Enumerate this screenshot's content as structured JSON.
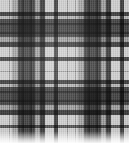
{
  "image": {
    "subject": "tartan-plaid-fabric-swatch",
    "width": 129,
    "height": 143,
    "palette_mode": "grayscale",
    "background_color": "#ffffff"
  },
  "chart_data": {
    "type": "heatmap",
    "xlabel": "warp position (px)",
    "ylabel": "weft position (px)",
    "xlim": [
      0,
      129
    ],
    "ylim": [
      0,
      143
    ],
    "grid": false,
    "legend_position": "none",
    "ground_color": "#c8c8c8",
    "sett_repeat_px": 66,
    "warp_stripes": [
      {
        "name": "light-ground-left",
        "x": 0,
        "width": 9,
        "color": "#d8d8d8",
        "alpha": 0.0
      },
      {
        "name": "accent-line-a1",
        "x": 9,
        "width": 1,
        "color": "#9a9a9a",
        "alpha": 0.55
      },
      {
        "name": "mid-shade-a",
        "x": 12,
        "width": 6,
        "color": "#b0b0b0",
        "alpha": 0.7
      },
      {
        "name": "dark-block-1",
        "x": 18,
        "width": 17,
        "color": "#4a4a4a",
        "alpha": 0.92
      },
      {
        "name": "accent-line-a2",
        "x": 22,
        "width": 2,
        "color": "#2e2e2e",
        "alpha": 0.7
      },
      {
        "name": "accent-line-a3",
        "x": 30,
        "width": 2,
        "color": "#2e2e2e",
        "alpha": 0.7
      },
      {
        "name": "mid-shade-b",
        "x": 35,
        "width": 5,
        "color": "#9e9e9e",
        "alpha": 0.65
      },
      {
        "name": "dark-line-1",
        "x": 40,
        "width": 5,
        "color": "#3c3c3c",
        "alpha": 0.9
      },
      {
        "name": "light-ground-mid",
        "x": 45,
        "width": 9,
        "color": "#e0e0e0",
        "alpha": 0.0
      },
      {
        "name": "dark-line-2",
        "x": 54,
        "width": 4,
        "color": "#3c3c3c",
        "alpha": 0.88
      },
      {
        "name": "light-ground-mid2",
        "x": 58,
        "width": 9,
        "color": "#e2e2e2",
        "alpha": 0.0
      },
      {
        "name": "hairline-center",
        "x": 67,
        "width": 1,
        "color": "#8e8e8e",
        "alpha": 0.5
      },
      {
        "name": "light-ground-mid3",
        "x": 68,
        "width": 7,
        "color": "#e2e2e2",
        "alpha": 0.0
      },
      {
        "name": "accent-line-b1",
        "x": 75,
        "width": 1,
        "color": "#9a9a9a",
        "alpha": 0.55
      },
      {
        "name": "mid-shade-c",
        "x": 78,
        "width": 6,
        "color": "#b0b0b0",
        "alpha": 0.7
      },
      {
        "name": "dark-block-2",
        "x": 84,
        "width": 17,
        "color": "#4a4a4a",
        "alpha": 0.92
      },
      {
        "name": "accent-line-b2",
        "x": 88,
        "width": 2,
        "color": "#2e2e2e",
        "alpha": 0.7
      },
      {
        "name": "accent-line-b3",
        "x": 96,
        "width": 2,
        "color": "#2e2e2e",
        "alpha": 0.7
      },
      {
        "name": "mid-shade-d",
        "x": 101,
        "width": 5,
        "color": "#9e9e9e",
        "alpha": 0.65
      },
      {
        "name": "dark-line-3",
        "x": 106,
        "width": 5,
        "color": "#3c3c3c",
        "alpha": 0.9
      },
      {
        "name": "light-ground-right",
        "x": 111,
        "width": 9,
        "color": "#e0e0e0",
        "alpha": 0.0
      },
      {
        "name": "dark-line-4",
        "x": 120,
        "width": 4,
        "color": "#3c3c3c",
        "alpha": 0.88
      },
      {
        "name": "light-ground-edge",
        "x": 124,
        "width": 5,
        "color": "#e2e2e2",
        "alpha": 0.0
      }
    ],
    "weft_stripes": [
      {
        "name": "light-band-top",
        "y": 0,
        "height": 12,
        "color": "#dcdcdc",
        "alpha": 0.0
      },
      {
        "name": "dark-line-t1",
        "y": 12,
        "height": 4,
        "color": "#3a3a3a",
        "alpha": 0.88
      },
      {
        "name": "mid-gap-t1",
        "y": 16,
        "height": 3,
        "color": "#b4b4b4",
        "alpha": 0.45
      },
      {
        "name": "dark-block-t",
        "y": 19,
        "height": 18,
        "color": "#484848",
        "alpha": 0.92
      },
      {
        "name": "accent-line-t1",
        "y": 23,
        "height": 2,
        "color": "#2c2c2c",
        "alpha": 0.7
      },
      {
        "name": "accent-line-t2",
        "y": 32,
        "height": 2,
        "color": "#2c2c2c",
        "alpha": 0.7
      },
      {
        "name": "mid-shade-t",
        "y": 37,
        "height": 5,
        "color": "#a0a0a0",
        "alpha": 0.65
      },
      {
        "name": "dark-line-t2",
        "y": 42,
        "height": 5,
        "color": "#3c3c3c",
        "alpha": 0.9
      },
      {
        "name": "light-band-mid",
        "y": 47,
        "height": 10,
        "color": "#e0e0e0",
        "alpha": 0.0
      },
      {
        "name": "dark-line-t3",
        "y": 57,
        "height": 4,
        "color": "#3c3c3c",
        "alpha": 0.86
      },
      {
        "name": "light-band-mid2",
        "y": 61,
        "height": 10,
        "color": "#e2e2e2",
        "alpha": 0.0
      },
      {
        "name": "hairline-mid",
        "y": 71,
        "height": 1,
        "color": "#8e8e8e",
        "alpha": 0.5
      },
      {
        "name": "light-band-mid3",
        "y": 72,
        "height": 8,
        "color": "#e2e2e2",
        "alpha": 0.0
      },
      {
        "name": "dark-line-b1",
        "y": 80,
        "height": 4,
        "color": "#3a3a3a",
        "alpha": 0.88
      },
      {
        "name": "mid-gap-b1",
        "y": 84,
        "height": 3,
        "color": "#b4b4b4",
        "alpha": 0.45
      },
      {
        "name": "dark-block-b",
        "y": 87,
        "height": 18,
        "color": "#484848",
        "alpha": 0.92
      },
      {
        "name": "accent-line-b1",
        "y": 91,
        "height": 2,
        "color": "#2c2c2c",
        "alpha": 0.7
      },
      {
        "name": "accent-line-b2",
        "y": 100,
        "height": 2,
        "color": "#2c2c2c",
        "alpha": 0.7
      },
      {
        "name": "mid-shade-b",
        "y": 105,
        "height": 5,
        "color": "#a0a0a0",
        "alpha": 0.65
      },
      {
        "name": "dark-line-b2",
        "y": 110,
        "height": 5,
        "color": "#3c3c3c",
        "alpha": 0.9
      },
      {
        "name": "light-band-low",
        "y": 115,
        "height": 10,
        "color": "#e0e0e0",
        "alpha": 0.0
      },
      {
        "name": "dark-line-b3",
        "y": 125,
        "height": 3,
        "color": "#4a4a4a",
        "alpha": 0.8
      },
      {
        "name": "light-band-bottom",
        "y": 128,
        "height": 15,
        "color": "#ececec",
        "alpha": 0.0
      }
    ]
  }
}
